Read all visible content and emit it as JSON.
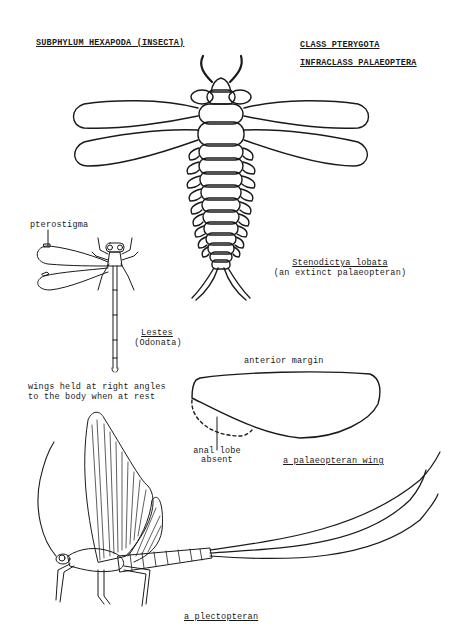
{
  "headings": {
    "subphylum": "SUBPHYLUM HEXAPODA (INSECTA)",
    "class": "CLASS PTERYGOTA",
    "infraclass": "INFRACLASS PALAEOPTERA"
  },
  "stenodictya": {
    "name": "Stenodictya lobata",
    "caption": "(an extinct palaeopteran)"
  },
  "lestes": {
    "pterostigma_label": "pterostigma",
    "name": "Lestes",
    "order": "(Odonata)",
    "note_line1": "wings held at right angles",
    "note_line2": "to the body when at rest"
  },
  "wing": {
    "anterior_margin": "anterior margin",
    "anal_lobe_line1": "anal lobe",
    "anal_lobe_line2": "absent",
    "caption": "a palaeopteran wing"
  },
  "plectopteran": {
    "caption": "a plectopteran"
  },
  "colors": {
    "ink": "#1a1a1a",
    "paper": "#ffffff"
  }
}
